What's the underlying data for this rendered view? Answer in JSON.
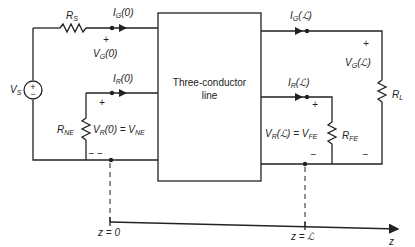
{
  "diagram": {
    "block": {
      "line1": "Three-conductor",
      "line2": "line"
    },
    "source": {
      "label": "V",
      "sub": "S",
      "plus": "+",
      "minus": "−"
    },
    "resistors": {
      "source": {
        "label": "R",
        "sub": "S"
      },
      "load": {
        "label": "R",
        "sub": "L"
      },
      "near_end": {
        "label": "R",
        "sub": "NE"
      },
      "far_end": {
        "label": "R",
        "sub": "FE"
      }
    },
    "currents": {
      "ig0": {
        "label": "I",
        "sub": "G",
        "arg": "(0)"
      },
      "ir0": {
        "label": "I",
        "sub": "R",
        "arg": "(0)"
      },
      "igL": {
        "label": "I",
        "sub": "G",
        "arg": "(ℒ)"
      },
      "irL": {
        "label": "I",
        "sub": "R",
        "arg": "(ℒ)"
      }
    },
    "voltages": {
      "vg0": {
        "label": "V",
        "sub": "G",
        "arg": "(0)",
        "plus": "+"
      },
      "vr0": {
        "label": "V",
        "sub": "R",
        "arg": "(0) = ",
        "rhs": "V",
        "rhs_sub": "NE",
        "plus": "+",
        "minus": "− −"
      },
      "vgL": {
        "label": "V",
        "sub": "G",
        "arg": "(ℒ)",
        "plus": "+",
        "minus": "−"
      },
      "vrL": {
        "label": "V",
        "sub": "R",
        "arg": "(ℒ) = ",
        "rhs": "V",
        "rhs_sub": "FE",
        "plus": "+",
        "minus": "−"
      }
    },
    "axis": {
      "z0": "z = 0",
      "zL": "z = ℒ",
      "z": "z"
    }
  }
}
